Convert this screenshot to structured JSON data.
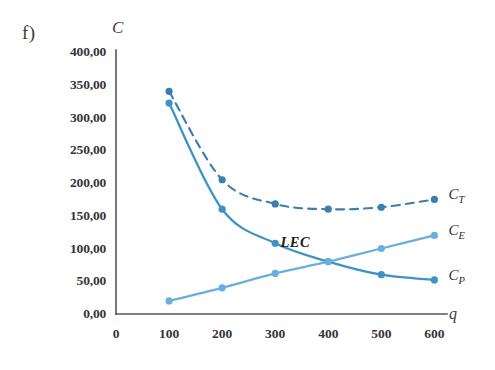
{
  "figure": {
    "panel_label": "f)",
    "axis_title_y": "C",
    "axis_title_x": "q",
    "annotation": "LEC"
  },
  "labels": {
    "ct": "C",
    "ct_sub": "T",
    "ce": "C",
    "ce_sub": "E",
    "cp": "C",
    "cp_sub": "P"
  },
  "colors": {
    "dark_blue": "#2b6c9e",
    "mid_blue": "#49a0cf",
    "light_blue": "#6aaede",
    "axis": "#555560"
  },
  "chart_data": {
    "type": "line",
    "title": "f)",
    "xlabel": "q",
    "ylabel": "C",
    "x": [
      100,
      200,
      300,
      400,
      500,
      600
    ],
    "xticks": [
      "0",
      "100",
      "200",
      "300",
      "400",
      "500",
      "600"
    ],
    "xtick_values": [
      0,
      100,
      200,
      300,
      400,
      500,
      600
    ],
    "yticks": [
      "0,00",
      "50,00",
      "100,00",
      "150,00",
      "200,00",
      "250,00",
      "300,00",
      "350,00",
      "400,00"
    ],
    "ytick_values": [
      0,
      50,
      100,
      150,
      200,
      250,
      300,
      350,
      400
    ],
    "xlim": [
      0,
      620
    ],
    "ylim": [
      0,
      400
    ],
    "grid": false,
    "legend_position": "right-of-axes",
    "annotations": [
      {
        "text": "LEC",
        "x": 395,
        "y": 104,
        "note": "marks crossing of C_E and C_P"
      }
    ],
    "series": [
      {
        "name": "C_T",
        "label": "CT",
        "style": "dashed",
        "color": "#3a7fae",
        "marker": "circle",
        "values": [
          340,
          205,
          168,
          160,
          163,
          175
        ]
      },
      {
        "name": "C_P",
        "label": "CP",
        "style": "solid",
        "color": "#3f93c4",
        "marker": "circle",
        "values": [
          322,
          160,
          108,
          80,
          60,
          52
        ]
      },
      {
        "name": "C_E",
        "label": "CE",
        "style": "solid",
        "color": "#6aaede",
        "marker": "circle",
        "values": [
          20,
          40,
          62,
          80,
          100,
          120
        ]
      }
    ]
  }
}
